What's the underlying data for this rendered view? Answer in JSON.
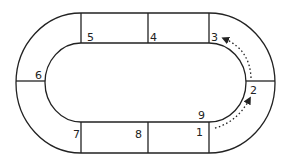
{
  "diagram": {
    "type": "oval-track",
    "stroke_color": "#222222",
    "background": "#ffffff",
    "sections": [
      {
        "id": 1,
        "label": "1",
        "position": "bottom-right straight"
      },
      {
        "id": 2,
        "label": "2",
        "position": "right curve lower"
      },
      {
        "id": 3,
        "label": "3",
        "position": "top-right straight"
      },
      {
        "id": 4,
        "label": "4",
        "position": "top-middle straight"
      },
      {
        "id": 5,
        "label": "5",
        "position": "top-left straight"
      },
      {
        "id": 6,
        "label": "6",
        "position": "left curve"
      },
      {
        "id": 7,
        "label": "7",
        "position": "bottom-left straight"
      },
      {
        "id": 8,
        "label": "8",
        "position": "bottom-middle straight"
      },
      {
        "id": 9,
        "label": "9",
        "position": "bottom-right inner corner"
      }
    ],
    "arrows": [
      {
        "from": "1",
        "to": "2",
        "style": "dotted"
      },
      {
        "from": "2",
        "to": "3",
        "style": "dotted"
      }
    ]
  }
}
